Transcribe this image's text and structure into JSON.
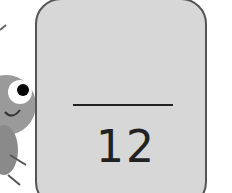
{
  "fraction": {
    "numerator": "",
    "denominator": "12"
  },
  "colors": {
    "card_fill": "#d7d7d7",
    "card_border": "#555555",
    "text": "#222222"
  },
  "illustration": {
    "name": "bug-character-peeking"
  }
}
